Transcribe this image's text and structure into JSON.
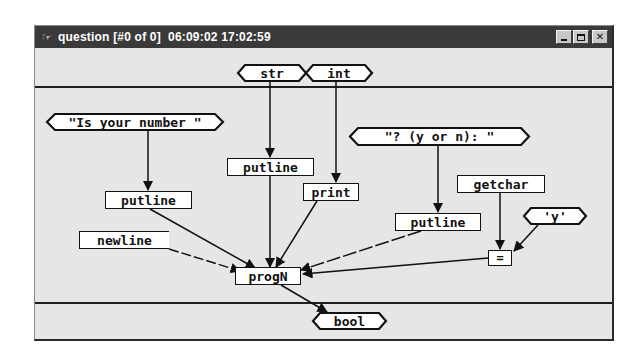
{
  "window": {
    "title": "question [#0 of 0]  06:09:02 17:02:59",
    "icon": "app-icon",
    "buttons": {
      "minimize": "minimize",
      "maximize": "maximize",
      "close": "✕"
    }
  },
  "graph": {
    "inputs": [
      {
        "id": "in-str",
        "label": "str"
      },
      {
        "id": "in-int",
        "label": "int"
      }
    ],
    "outputs": [
      {
        "id": "out-bool",
        "label": "bool"
      }
    ],
    "constants": [
      {
        "id": "const-is-your-number",
        "label": "\"Is your number \""
      },
      {
        "id": "const-y-or-n",
        "label": "\"? (y or n): \""
      },
      {
        "id": "const-y",
        "label": "'y'"
      }
    ],
    "operations": [
      {
        "id": "op-putline-top",
        "label": "putline"
      },
      {
        "id": "op-putline-left",
        "label": "putline"
      },
      {
        "id": "op-print",
        "label": "print"
      },
      {
        "id": "op-getchar",
        "label": "getchar"
      },
      {
        "id": "op-putline-right",
        "label": "putline"
      },
      {
        "id": "op-newline",
        "label": "newline"
      },
      {
        "id": "op-equals",
        "label": "="
      },
      {
        "id": "op-progn",
        "label": "progN"
      }
    ],
    "edges": [
      {
        "from": "in-str",
        "to": "op-putline-top"
      },
      {
        "from": "in-int",
        "to": "op-print"
      },
      {
        "from": "const-is-your-number",
        "to": "op-putline-left"
      },
      {
        "from": "const-y-or-n",
        "to": "op-putline-right"
      },
      {
        "from": "op-getchar",
        "to": "op-equals"
      },
      {
        "from": "const-y",
        "to": "op-equals"
      },
      {
        "from": "op-putline-left",
        "to": "op-progn"
      },
      {
        "from": "op-newline",
        "to": "op-progn"
      },
      {
        "from": "op-putline-top",
        "to": "op-progn"
      },
      {
        "from": "op-print",
        "to": "op-progn"
      },
      {
        "from": "op-putline-right",
        "to": "op-progn"
      },
      {
        "from": "op-equals",
        "to": "op-progn"
      },
      {
        "from": "op-progn",
        "to": "out-bool"
      }
    ]
  },
  "colors": {
    "titlebar": "#3a3a3a",
    "canvas": "#e6e6e6",
    "node_fill": "#ffffff",
    "stroke": "#111111"
  }
}
